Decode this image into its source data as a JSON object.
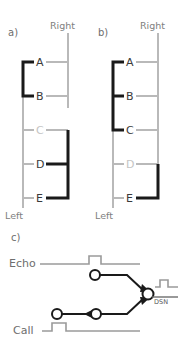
{
  "figure": {
    "panels": [
      {
        "tag": "a)",
        "top_label": "Right",
        "bottom_label": "Left",
        "rungs": [
          {
            "label": "A",
            "state": "on"
          },
          {
            "label": "B",
            "state": "on"
          },
          {
            "label": "C",
            "state": "off"
          },
          {
            "label": "D",
            "state": "on"
          },
          {
            "label": "E",
            "state": "on"
          }
        ],
        "left_bracket": {
          "from": "A",
          "to": "B"
        },
        "right_bracket": {
          "from": "C",
          "to": "E"
        }
      },
      {
        "tag": "b)",
        "top_label": "Right",
        "bottom_label": "Left",
        "rungs": [
          {
            "label": "A",
            "state": "on"
          },
          {
            "label": "B",
            "state": "on"
          },
          {
            "label": "C",
            "state": "on"
          },
          {
            "label": "D",
            "state": "off"
          },
          {
            "label": "E",
            "state": "on"
          }
        ],
        "left_bracket": {
          "from": "A",
          "to": "C"
        },
        "right_bracket": {
          "from": "D",
          "to": "E"
        }
      }
    ],
    "circuit": {
      "tag": "c)",
      "signals": [
        {
          "name": "Echo",
          "pulse": "late"
        },
        {
          "name": "Call",
          "pulse": "early"
        }
      ],
      "output_node": {
        "label": "DSN",
        "pulse": "present"
      },
      "nodes": [
        {
          "id": "echo-node"
        },
        {
          "id": "call-node-left"
        },
        {
          "id": "call-node-right"
        },
        {
          "id": "dsn-node"
        }
      ]
    },
    "colors": {
      "dark": "#1a1a1a",
      "mid": "#6e6e6e",
      "light": "#b9b9b9",
      "faint": "#c4c4c4"
    }
  }
}
